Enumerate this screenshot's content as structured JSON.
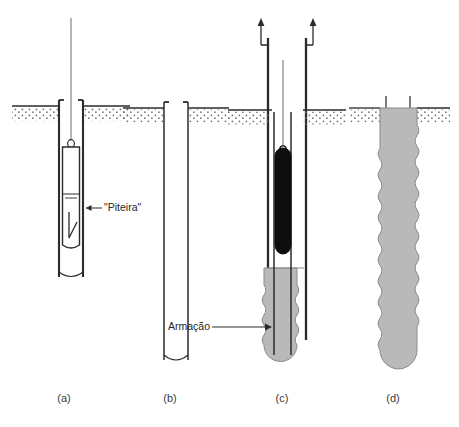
{
  "figure": {
    "panels": [
      {
        "id": "a",
        "caption": "(a)",
        "description": "Escavacao com piteira suspensa por cabo dentro do furo revestido"
      },
      {
        "id": "b",
        "caption": "(b)",
        "description": "Furo escavado concluido e vazio"
      },
      {
        "id": "c",
        "caption": "(c)",
        "description": "Concretagem com retirada do revestimento e colocacao da armacao"
      },
      {
        "id": "d",
        "caption": "(d)",
        "description": "Estaca concluida com base alargada e arranques de armacao"
      }
    ],
    "annotations": [
      {
        "id": "piteira",
        "label": "\"Piteira\"",
        "target_panel": "a",
        "leader": "arrow-left"
      },
      {
        "id": "armacao",
        "label": "Armação",
        "target_panel": "c",
        "leader": "arrow-right"
      }
    ],
    "icons": {
      "withdraw_arrow_left": "arrow-up-icon",
      "withdraw_arrow_right": "arrow-up-icon"
    },
    "colors": {
      "outline": "#2b2b2b",
      "concrete_fill": "#b9b9b9",
      "concrete_stroke": "#8a8a8a",
      "bucket_fill": "#0d0d0d",
      "soil_dots": "#6f6f6f",
      "ground_line": "#2b2b2b",
      "background": "#ffffff",
      "caption_text": "#3a3a3a",
      "annotation_text": "#262626"
    }
  }
}
